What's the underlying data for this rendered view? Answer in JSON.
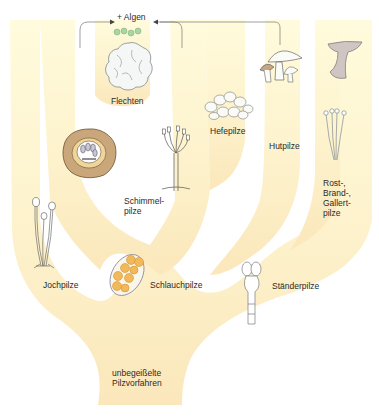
{
  "diagram": {
    "type": "phylogenetic-tree",
    "colors": {
      "tree_fill_top": "#fffbdc",
      "tree_fill_bottom": "#fbe9bf",
      "background": "#ffffff",
      "text": "#2a2a2a",
      "algae": "#9fcf9a",
      "ascus_cells": "#f2b95a"
    },
    "root": {
      "label": "unbegeißelte\nPilzvorfahren"
    },
    "symbiosis": {
      "label": "+ Algen"
    },
    "groups": [
      {
        "id": "jochpilze",
        "label": "Jochpilze"
      },
      {
        "id": "schlauchpilze",
        "label": "Schlauchpilze"
      },
      {
        "id": "schimmelpilze",
        "label": "Schimmel-\npilze"
      },
      {
        "id": "flechten",
        "label": "Flechten"
      },
      {
        "id": "hefepilze",
        "label": "Hefepilze"
      },
      {
        "id": "staenderpilze",
        "label": "Ständerpilze"
      },
      {
        "id": "hutpilze",
        "label": "Hutpilze"
      },
      {
        "id": "rost-brand-gallertpilze",
        "label": "Rost-,\nBrand-,\nGallert-\npilze"
      }
    ]
  }
}
